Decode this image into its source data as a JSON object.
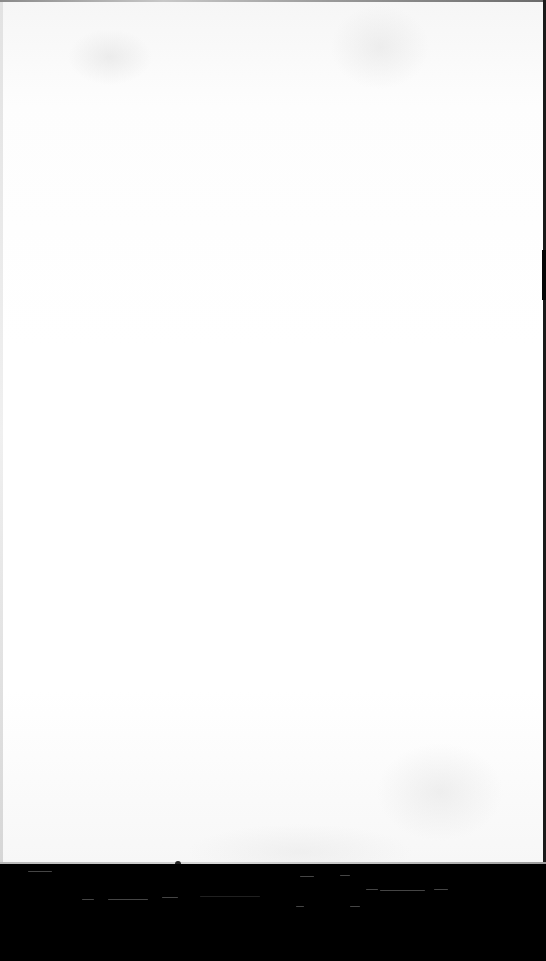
{
  "scene": {
    "description": "Blank white sheet of paper photographed on a black surface",
    "paper_color": "#ffffff",
    "surface_color": "#000000",
    "text_content": []
  }
}
